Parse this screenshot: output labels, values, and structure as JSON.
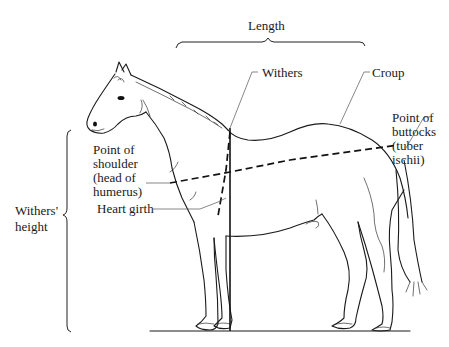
{
  "labels": {
    "length": "Length",
    "withers": "Withers",
    "croup": "Croup",
    "point_of_buttocks": [
      "Point of",
      "buttocks",
      "(tuber",
      "ischii)"
    ],
    "point_of_shoulder": [
      "Point of",
      "shoulder",
      "(head of",
      "humerus)"
    ],
    "heart_girth": "Heart girth",
    "withers_height": [
      "Withers'",
      "height"
    ]
  },
  "colors": {
    "line": "#1a1a1a",
    "background": "#ffffff"
  }
}
